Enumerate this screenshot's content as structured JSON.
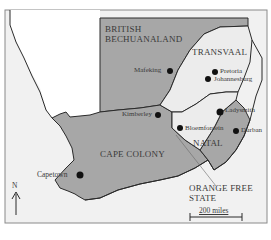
{
  "map": {
    "title": "",
    "colors": {
      "sea": "#f1f1f1",
      "foreign_land": "#ffffff",
      "british": "#a7a7a7",
      "boer": "#ececec",
      "border": "#2a2a2a",
      "frame": "#8a8a8a",
      "text": "#3a3a3a"
    },
    "regions": [
      {
        "name": "British Bechuanaland",
        "line1": "BRITISH",
        "line2": "BECHUANALAND"
      },
      {
        "name": "Transvaal",
        "label": "TRANSVAAL"
      },
      {
        "name": "Cape Colony",
        "label": "CAPE COLONY"
      },
      {
        "name": "Natal",
        "label": "NATAL"
      },
      {
        "name": "Orange Free State",
        "line1": "ORANGE FREE",
        "line2": "STATE"
      }
    ],
    "cities": [
      {
        "name": "Mafeking"
      },
      {
        "name": "Pretoria"
      },
      {
        "name": "Johannesburg"
      },
      {
        "name": "Kimberley"
      },
      {
        "name": "Ladysmith"
      },
      {
        "name": "Bloemfontein"
      },
      {
        "name": "Durban"
      },
      {
        "name": "Capetown"
      }
    ],
    "compass": {
      "label": "N",
      "icon": "north-arrow-icon"
    },
    "scale": {
      "label": "200 miles"
    }
  }
}
